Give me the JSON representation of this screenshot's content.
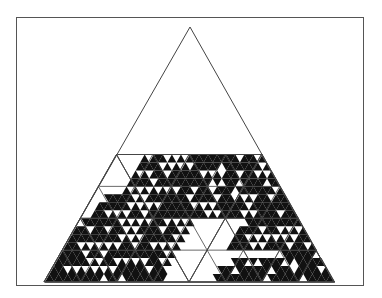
{
  "figure": {
    "colors": {
      "frame": "#555555",
      "line": "#444444",
      "fill": "#111111",
      "background": "#ffffff"
    },
    "triangle": {
      "apex": [
        190,
        27
      ],
      "base_left": [
        44,
        282
      ],
      "base_right": [
        334,
        282
      ]
    },
    "lattice": {
      "level": 32,
      "start_row_y": 154.5,
      "rows": [
        "0000001011101010111111111110111010100000000",
        "000000111110101010111111011111111010100000000",
        "00000010101110111111101010111011101011100000000",
        "0000001111101111111111110101110111110111110000000",
        "000000101010101010111011101111011111111010000000000",
        "00011111101011111111101111101110101011101110000000000",
        "0011111110101010111111101010111111101111111111000000000",
        "001110101011101111111111111010111110101111101110100000000",
        "01111111101010101110101010000000000001111111111111111000000",
        "1110111011101011111011101000000000001111101110101011111100000",
        "111111111110101011111110100000000000111010101010101111111110000",
        "11101010101011101110101010000000000011111010111110111011111110000",
        "1111101110111111111111101000000000000000000000000111111101111111000",
        "111111101011101010101110100000000000000111010111110101111111101111000",
        "11101010101010111111101110000000000001110111111101111011111011101110000",
        "1111111111110111011111111100000000000111111111110111111101111111111100000"
      ]
    },
    "guides": {
      "levels": [
        2,
        4,
        8
      ]
    }
  }
}
